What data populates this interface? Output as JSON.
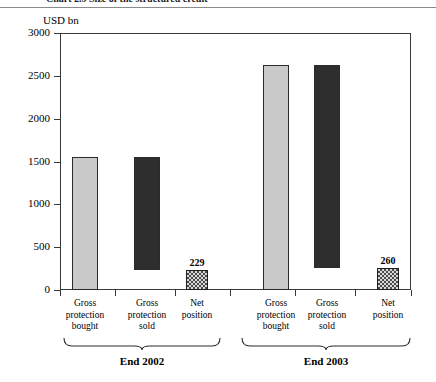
{
  "caption": {
    "text": "Chart 2.9  Size of the structured credit"
  },
  "chart_data": {
    "type": "bar",
    "title": "",
    "subtitle": "",
    "xlabel": "",
    "ylabel": "USD bn",
    "ylim": [
      0,
      3000
    ],
    "ytick_values": [
      0,
      500,
      1000,
      1500,
      2000,
      2500,
      3000
    ],
    "ytick_labels": [
      "0",
      "500",
      "1000",
      "1500",
      "2000",
      "2500",
      "3000"
    ],
    "grid": false,
    "legend": null,
    "groups": [
      {
        "label": "End 2002",
        "categories": [
          "Gross protection bought",
          "Gross protection sold",
          "Net position"
        ],
        "bars": [
          {
            "name": "Gross protection bought",
            "line1": "Gross",
            "line2": "protection",
            "line3": "bought",
            "base": 0,
            "top": 1551,
            "value": 1551,
            "style": "light",
            "value_label": ""
          },
          {
            "name": "Gross protection sold",
            "line1": "Gross",
            "line2": "protection",
            "line3": "sold",
            "base": 229,
            "top": 1551,
            "value": 1322,
            "style": "dark",
            "value_label": ""
          },
          {
            "name": "Net position",
            "line1": "Net",
            "line2": "position",
            "line3": "",
            "base": 0,
            "top": 229,
            "value": 229,
            "style": "checker",
            "value_label": "229"
          }
        ]
      },
      {
        "label": "End 2003",
        "categories": [
          "Gross protection bought",
          "Gross protection sold",
          "Net position"
        ],
        "bars": [
          {
            "name": "Gross protection bought",
            "line1": "Gross",
            "line2": "protection",
            "line3": "bought",
            "base": 0,
            "top": 2625,
            "value": 2625,
            "style": "light",
            "value_label": ""
          },
          {
            "name": "Gross protection sold",
            "line1": "Gross",
            "line2": "protection",
            "line3": "sold",
            "base": 260,
            "top": 2625,
            "value": 2365,
            "style": "dark",
            "value_label": ""
          },
          {
            "name": "Net position",
            "line1": "Net",
            "line2": "position",
            "line3": "",
            "base": 0,
            "top": 260,
            "value": 260,
            "style": "checker",
            "value_label": "260"
          }
        ]
      }
    ],
    "colors": {
      "bought_bar": "#c9c9c9",
      "sold_bar": "#2e2e2e",
      "net_bar": "#d9d9d9",
      "axis": "#3a3a3a",
      "text": "#000000"
    }
  }
}
